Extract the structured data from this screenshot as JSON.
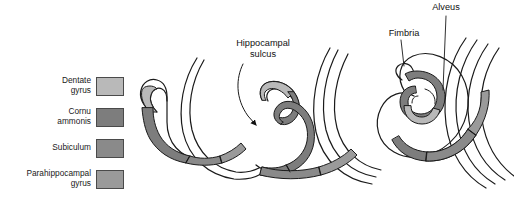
{
  "figure": {
    "background_color": "#ffffff",
    "line_color": "#1a1a1a",
    "width": 514,
    "height": 201
  },
  "legend": {
    "items": [
      {
        "label": "Dentate\ngyrus",
        "color": "#b9b9b9",
        "border": "#4a4a4a",
        "name": "dentate-gyrus"
      },
      {
        "label": "Cornu\nammonis",
        "color": "#7d7d7d",
        "border": "#4a4a4a",
        "name": "cornu-ammonis"
      },
      {
        "label": "Subiculum",
        "color": "#8a8a8a",
        "border": "#4a4a4a",
        "name": "subiculum"
      },
      {
        "label": "Parahippocampal\ngyrus",
        "color": "#9a9a9a",
        "border": "#4a4a4a",
        "name": "parahippocampal-gyrus"
      }
    ]
  },
  "callouts": {
    "hippocampal_sulcus": "Hippocampal\nsulcus",
    "fimbria": "Fimbria",
    "alveus": "Alveus"
  },
  "panels": [
    {
      "id": "panel-1",
      "stage": "early",
      "description": "C-shaped hook, open anterior"
    },
    {
      "id": "panel-2",
      "stage": "intermediate",
      "description": "S-curve infolding at hippocampal sulcus"
    },
    {
      "id": "panel-3",
      "stage": "mature",
      "description": "Interlocked spiral with fimbria and alveus"
    }
  ]
}
